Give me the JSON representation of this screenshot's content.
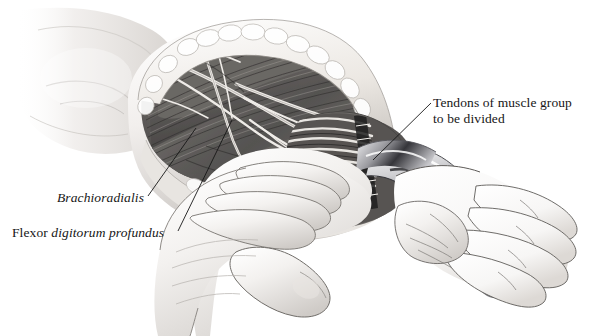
{
  "figure": {
    "kind": "surgical-illustration",
    "background_color": "#ffffff",
    "ink_color": "#161616",
    "palette": {
      "skin_light": "#f4f2f0",
      "skin_mid": "#d8d4d1",
      "skin_shadow": "#9b9793",
      "muscle_dark": "#4a4846",
      "muscle_mid": "#7d7a77",
      "fat_pale": "#ece9e5",
      "instrument_steel": "#b9b9bb",
      "instrument_dark": "#3c3c3e",
      "tendon_pale": "#e6e3df",
      "outline": "#2a2a2a"
    }
  },
  "labels": {
    "brachioradialis": {
      "text": "Brachioradialis",
      "style": "italic",
      "leader_from": [
        148,
        196
      ],
      "leader_to": [
        196,
        128
      ]
    },
    "flexor_digitorum_profundus": {
      "roman_part": "Flexor",
      "italic_part": "digitorum profundus",
      "full_text": "Flexor digitorum profundus",
      "leader_from": [
        178,
        231
      ],
      "leader_to": [
        232,
        120
      ]
    },
    "tendons": {
      "line1": "Tendons of muscle group",
      "line2": "to be divided",
      "style": "roman",
      "leader_from": [
        431,
        103
      ],
      "leader_to": [
        373,
        160
      ]
    }
  },
  "anatomy": {
    "structures": [
      "upper arm",
      "retracted skin and subcutaneous fat edge",
      "brachioradialis muscle belly",
      "flexor digitorum profundus muscle belly",
      "superficial nerves and vessels",
      "flexor tendon group",
      "surgeon's gripping hand",
      "surgeon's thumb",
      "patient's open hand",
      "curved surgical retractor beneath tendons"
    ]
  }
}
